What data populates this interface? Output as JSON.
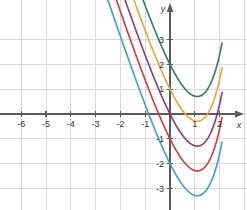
{
  "figure": {
    "width": 247,
    "height": 210,
    "background": "#ffffff"
  },
  "chart_data": {
    "type": "line",
    "title": "",
    "subtitle": "",
    "xlabel": "x",
    "ylabel": "y",
    "xlim": [
      -6.8,
      3.05
    ],
    "ylim": [
      -3.65,
      3.8
    ],
    "xticks": [
      -6,
      -5,
      -4,
      -3,
      -2,
      -1,
      1,
      2
    ],
    "yticks": [
      3,
      2,
      1,
      -1,
      -2,
      -3
    ],
    "xtick_labels": [
      "-6",
      "-5",
      "-4",
      "-3",
      "-2",
      "-1",
      "1",
      "2"
    ],
    "ytick_labels": [
      "3",
      "2",
      "1",
      "-1",
      "-2",
      "-3"
    ],
    "grid": true,
    "grid_color": "#d8d8dd",
    "grid_spacing": 1,
    "axis_color": "#5a5a5a",
    "legend": "none",
    "legend_position": "none",
    "annotations": [],
    "series": [
      {
        "name": "curve-green",
        "color": "#2e7d5b",
        "y_intercept": 2,
        "offset": 2,
        "minimum": [
          1.1,
          0.7
        ],
        "points_x": [
          -6.8,
          -6.4,
          -6.0,
          -5.6,
          -5.2,
          -4.8,
          -4.4,
          -4.0,
          -3.6,
          -3.2,
          -2.8,
          -2.4,
          -2.0,
          -1.6,
          -1.2,
          -0.8,
          -0.4,
          0.0,
          0.2,
          0.4,
          0.6,
          0.8,
          1.0,
          1.2,
          1.4
        ],
        "points_y": [
          0.05,
          0.06,
          0.08,
          0.1,
          0.12,
          0.15,
          0.19,
          0.23,
          0.3,
          0.37,
          0.46,
          0.58,
          0.74,
          0.95,
          1.22,
          1.58,
          2.05,
          2.67,
          3.0,
          3.38,
          3.8,
          4.3,
          4.9,
          5.6,
          6.4
        ]
      },
      {
        "name": "curve-orange",
        "color": "#e8a33d",
        "y_intercept": 1,
        "offset": 1,
        "minimum": [
          1.1,
          -0.3
        ],
        "points_x": [
          -6.8,
          -6.4,
          -6.0,
          -5.6,
          -5.2,
          -4.8,
          -4.4,
          -4.0,
          -3.6,
          -3.2,
          -2.8,
          -2.4,
          -2.0,
          -1.6,
          -1.2,
          -0.8,
          -0.4,
          0.0,
          0.2,
          0.4,
          0.6,
          0.8,
          1.0,
          1.2,
          1.4
        ],
        "points_y": [
          0.02,
          0.03,
          0.04,
          0.05,
          0.07,
          0.09,
          0.11,
          0.14,
          0.18,
          0.23,
          0.3,
          0.39,
          0.5,
          0.66,
          0.86,
          1.12,
          1.47,
          1.93,
          2.2,
          2.5,
          2.85,
          3.28,
          3.8,
          4.45,
          5.2
        ]
      },
      {
        "name": "curve-purple",
        "color": "#8e3a6e",
        "y_intercept": 0,
        "offset": 0,
        "minimum": [
          1.1,
          -0.35
        ],
        "points_x": [
          -6.8,
          -6.4,
          -6.0,
          -5.6,
          -5.2,
          -4.8,
          -4.4,
          -4.0,
          -3.6,
          -3.2,
          -2.8,
          -2.4,
          -2.0,
          -1.6,
          -1.2,
          -0.8,
          -0.4,
          0.0,
          0.2,
          0.4,
          0.6,
          0.8,
          1.0,
          1.2,
          1.4
        ],
        "points_y": [
          0.0,
          0.0,
          0.0,
          0.01,
          0.01,
          0.02,
          0.03,
          0.04,
          0.06,
          0.08,
          0.11,
          0.15,
          0.2,
          0.27,
          0.36,
          0.48,
          0.63,
          0.83,
          0.95,
          1.1,
          1.3,
          1.55,
          1.9,
          2.35,
          2.95
        ]
      },
      {
        "name": "curve-red",
        "color": "#cf3b38",
        "y_intercept": -1,
        "offset": -1,
        "minimum": [
          1.1,
          -1.35
        ],
        "points_x": [
          -6.8,
          -6.4,
          -6.0,
          -5.6,
          -5.2,
          -4.8,
          -4.4,
          -4.0,
          -3.6,
          -3.2,
          -2.8,
          -2.4,
          -2.0,
          -1.6,
          -1.2,
          -0.8,
          -0.4,
          0.0,
          0.2,
          0.4,
          0.6,
          0.8,
          1.0,
          1.2,
          1.4
        ],
        "points_y": [
          0.0,
          0.0,
          0.0,
          0.0,
          0.0,
          -0.01,
          -0.02,
          -0.03,
          -0.05,
          -0.08,
          -0.12,
          -0.18,
          -0.27,
          -0.4,
          -0.58,
          -0.82,
          -1.08,
          -1.3,
          -1.35,
          -1.35,
          -1.28,
          -1.1,
          -0.8,
          -0.3,
          0.45
        ]
      },
      {
        "name": "curve-blue",
        "color": "#3d9ec9",
        "y_intercept": -2,
        "offset": -2,
        "minimum": [
          1.1,
          -3.0
        ],
        "points_x": [
          -6.8,
          -6.4,
          -6.0,
          -5.6,
          -5.2,
          -4.8,
          -4.4,
          -4.0,
          -3.6,
          -3.2,
          -2.8,
          -2.4,
          -2.0,
          -1.6,
          -1.2,
          -0.8,
          -0.4,
          0.0,
          0.2,
          0.4,
          0.6,
          0.8,
          1.0,
          1.2,
          1.4
        ],
        "points_y": [
          0.0,
          0.0,
          0.0,
          -0.01,
          -0.02,
          -0.04,
          -0.07,
          -0.11,
          -0.17,
          -0.26,
          -0.38,
          -0.55,
          -0.78,
          -1.08,
          -1.47,
          -1.92,
          -2.38,
          -2.73,
          -2.9,
          -2.99,
          -3.0,
          -2.92,
          -2.7,
          -2.25,
          -1.5
        ]
      }
    ]
  }
}
